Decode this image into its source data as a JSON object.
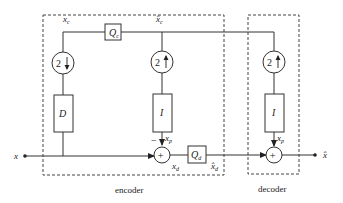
{
  "diagram": {
    "title": "",
    "groups": {
      "encoder": {
        "label": "encoder"
      },
      "decoder": {
        "label": "decoder"
      }
    },
    "signals": {
      "input": {
        "label": "x"
      },
      "output": {
        "label": "x̂"
      },
      "xc": {
        "label": "x",
        "sub": "c"
      },
      "xc_hat": {
        "label": "x̂",
        "sub": "c"
      },
      "xp_enc": {
        "label": "x",
        "sub": "p"
      },
      "xp_dec": {
        "label": "x",
        "sub": "p"
      },
      "xd": {
        "label": "x",
        "sub": "d"
      },
      "xd_hat": {
        "label": "x̂",
        "sub": "d"
      },
      "minus": {
        "label": "−"
      }
    },
    "blocks": {
      "Qc": {
        "label": "Q",
        "sub": "c"
      },
      "Qd": {
        "label": "Q",
        "sub": "d"
      },
      "D": {
        "label": "D"
      },
      "I_enc": {
        "label": "I"
      },
      "I_dec": {
        "label": "I"
      },
      "down2": {
        "label": "2",
        "arrow": "down"
      },
      "up2_enc": {
        "label": "2",
        "arrow": "up"
      },
      "up2_dec": {
        "label": "2",
        "arrow": "up"
      },
      "sum_enc": {
        "label": "+"
      },
      "sum_dec": {
        "label": "+"
      }
    }
  }
}
